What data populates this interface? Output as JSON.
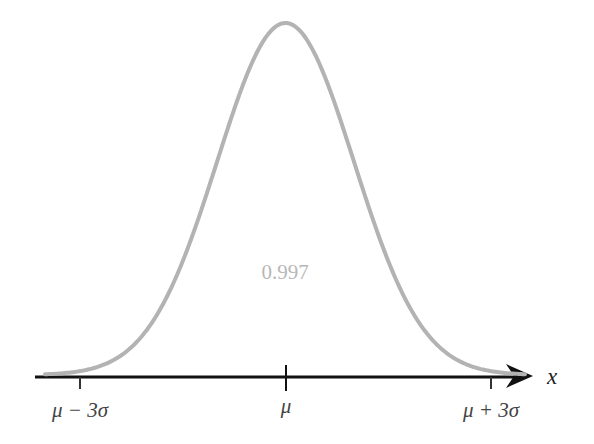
{
  "chart_data": {
    "type": "line",
    "title": "",
    "xlabel": "x",
    "ylabel": "",
    "x_ticks": [
      "μ − 3σ",
      "μ",
      "μ + 3σ"
    ],
    "x_tick_positions_sigma": [
      -3,
      0,
      3
    ],
    "area_annotation": "0.997",
    "curve": "standard normal density",
    "grid": false,
    "legend": null
  },
  "labels": {
    "tick_left": "μ − 3σ",
    "tick_center": "μ",
    "tick_right": "μ + 3σ",
    "axis_label": "x",
    "area_value": "0.997"
  },
  "colors": {
    "curve": "#b3b3b3",
    "axis": "#111111",
    "area_text": "#b8b8b8",
    "tick_label": "#444444"
  }
}
